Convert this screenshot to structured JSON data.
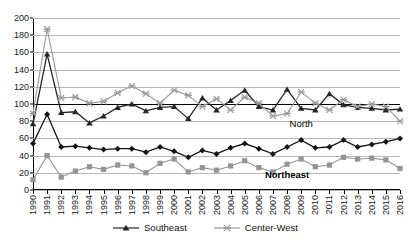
{
  "chart_data": {
    "type": "line",
    "title": "",
    "subtitle": "",
    "xlabel": "",
    "ylabel": "",
    "ylim": [
      0,
      200
    ],
    "ytick_step": 20,
    "yticks": [
      0,
      20,
      40,
      60,
      80,
      100,
      120,
      140,
      160,
      180,
      200
    ],
    "grid": true,
    "emphasized_gridline": 100,
    "legend_position": "bottom-center",
    "categories": [
      "1990",
      "1991",
      "1992",
      "1993",
      "1994",
      "1995",
      "1996",
      "1997",
      "1998",
      "1999",
      "2000",
      "2001",
      "2002",
      "2003",
      "2004",
      "2005",
      "2006",
      "2007",
      "2008",
      "2009",
      "2010",
      "2011",
      "2012",
      "2013",
      "2014",
      "2015",
      "2016"
    ],
    "series": [
      {
        "name": "Southeast",
        "color": "#262626",
        "marker": "triangle",
        "in_chart_label": "",
        "values": [
          77,
          158,
          90,
          91,
          78,
          86,
          96,
          100,
          92,
          96,
          97,
          83,
          107,
          93,
          104,
          116,
          97,
          93,
          117,
          95,
          93,
          112,
          99,
          96,
          95,
          93,
          94
        ]
      },
      {
        "name": "Center-West",
        "color": "#9a9a9a",
        "marker": "x",
        "in_chart_label": "",
        "values": [
          89,
          187,
          107,
          108,
          101,
          103,
          113,
          121,
          112,
          101,
          116,
          110,
          97,
          106,
          93,
          108,
          101,
          86,
          89,
          114,
          101,
          93,
          105,
          97,
          100,
          97,
          80
        ]
      },
      {
        "name": "North",
        "color": "#141414",
        "marker": "diamond",
        "in_chart_label": "North",
        "values": [
          54,
          88,
          50,
          51,
          49,
          47,
          48,
          48,
          44,
          50,
          45,
          38,
          46,
          42,
          49,
          54,
          48,
          42,
          50,
          58,
          49,
          50,
          58,
          50,
          53,
          56,
          60
        ]
      },
      {
        "name": "Northeast",
        "color": "#949494",
        "marker": "square",
        "in_chart_label": "Northeast",
        "values": [
          12,
          40,
          15,
          22,
          27,
          24,
          29,
          28,
          20,
          31,
          36,
          21,
          26,
          23,
          28,
          34,
          26,
          21,
          30,
          36,
          27,
          29,
          38,
          36,
          37,
          35,
          25
        ]
      }
    ],
    "annotations": [
      {
        "text": "North",
        "series": "North"
      },
      {
        "text": "Northeast",
        "series": "Northeast"
      }
    ]
  },
  "legend": {
    "items": [
      {
        "label": "Southeast",
        "marker": "triangle",
        "color": "#262626"
      },
      {
        "label": "Center-West",
        "marker": "x",
        "color": "#9a9a9a"
      }
    ]
  }
}
